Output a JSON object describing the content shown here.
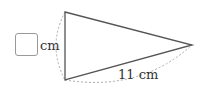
{
  "diagram": {
    "type": "isosceles-triangle-with-arcs",
    "vertices": {
      "top": [
        65,
        12
      ],
      "bottom": [
        65,
        80
      ],
      "apex": [
        192,
        45
      ]
    },
    "answer_box": {
      "unit": "cm",
      "value": ""
    },
    "side_label": "11 cm",
    "colors": {
      "edge": "#555555",
      "dashed_arc": "#aaaaaa",
      "box_border": "#999999",
      "text": "#333333"
    }
  }
}
